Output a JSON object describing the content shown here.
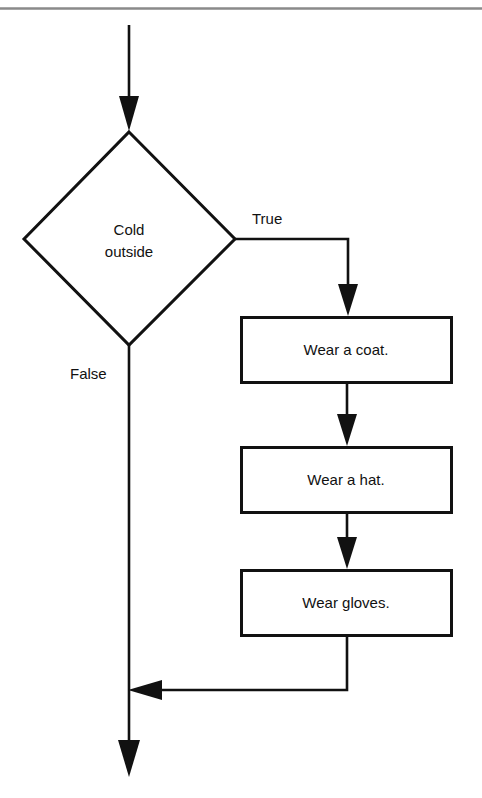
{
  "diagram": {
    "type": "flowchart",
    "colors": {
      "stroke": "#111111",
      "text": "#111111",
      "background": "#ffffff",
      "top_rule": "#8a8a8a"
    },
    "top_rule": {
      "name": "horizontal-divider",
      "visible": true
    },
    "decision": {
      "shape": "diamond",
      "line1": "Cold",
      "line2": "outside"
    },
    "branch_labels": {
      "true": "True",
      "false": "False"
    },
    "process_steps": [
      {
        "label": "Wear a coat."
      },
      {
        "label": "Wear a hat."
      },
      {
        "label": "Wear gloves."
      }
    ]
  }
}
